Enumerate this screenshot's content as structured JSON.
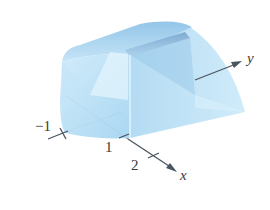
{
  "figure": {
    "type": "3d-solid-diagram",
    "colors": {
      "solid_fill": "#a9d8f3",
      "solid_light": "#d6effb",
      "solid_dark": "#7fb8e0",
      "band": "#6f9fc9",
      "axis": "#4a5560",
      "label": "#3a3a3a"
    },
    "axes": {
      "x": {
        "label": "x",
        "ticks": [
          "1",
          "2"
        ]
      },
      "y": {
        "label": "y",
        "ticks": [
          "−1"
        ]
      }
    }
  }
}
